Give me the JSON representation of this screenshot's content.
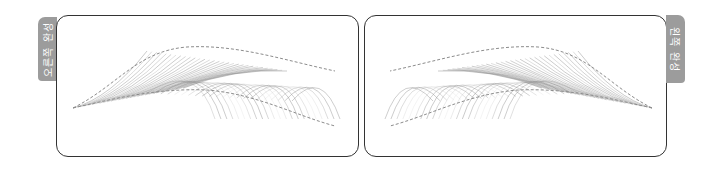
{
  "panels": [
    {
      "id": "left",
      "tab_label": "오른쪽 완성",
      "orientation": "tail-left"
    },
    {
      "id": "right",
      "tab_label": "왼쪽 완성",
      "orientation": "tail-right"
    }
  ],
  "colors": {
    "tab_bg": "#9c9c9c",
    "tab_text": "#ffffff",
    "border": "#333333",
    "hair_stroke": "#8a8a8a",
    "outline_dash": "#8c8c8c"
  }
}
